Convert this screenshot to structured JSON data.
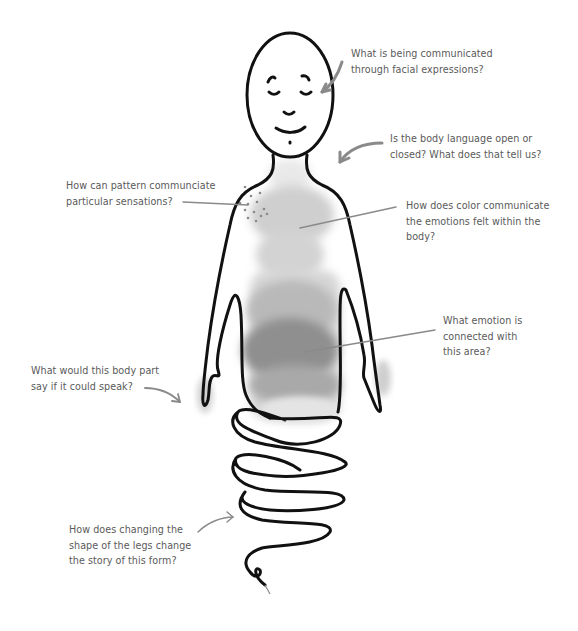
{
  "diagram": {
    "type": "annotated body map illustration",
    "figure": {
      "description": "Line drawing of a smiling bald figure with watercolor gray shading on the torso and coiled spring-like legs",
      "line_color": "#111111",
      "annotation_line_color": "#8a8a8a",
      "text_color": "#5a5a5a",
      "shading_colors": [
        "#e6e6e6",
        "#c9c9c9",
        "#a8a8a8",
        "#8c8c8c"
      ]
    },
    "annotations": [
      {
        "id": "facial-expressions",
        "lines": [
          "What is being communicated",
          "through facial expressions?"
        ],
        "pointer": "curved-arrow",
        "target": "face"
      },
      {
        "id": "body-language",
        "lines": [
          "Is the body language open or",
          "closed? What does that tell us?"
        ],
        "pointer": "curved-arrow",
        "target": "shoulder"
      },
      {
        "id": "pattern",
        "lines": [
          "How can pattern communciate",
          "particular sensations?"
        ],
        "pointer": "straight-line",
        "target": "dotted pattern on shoulder"
      },
      {
        "id": "color",
        "lines": [
          "How does color communicate",
          "the emotions felt within the",
          "body?"
        ],
        "pointer": "straight-line",
        "target": "upper chest shading"
      },
      {
        "id": "emotion-area",
        "lines": [
          "What emotion is",
          "connected with",
          "this area?"
        ],
        "pointer": "straight-line",
        "target": "abdomen dark shading"
      },
      {
        "id": "body-part-speak",
        "lines": [
          "What would this body part",
          "say if it could speak?"
        ],
        "pointer": "curved-arrow",
        "target": "left hand"
      },
      {
        "id": "legs-shape",
        "lines": [
          "How does changing the",
          "shape of the legs change",
          "the story of this form?"
        ],
        "pointer": "curved-arrow",
        "target": "coiled legs"
      }
    ]
  }
}
